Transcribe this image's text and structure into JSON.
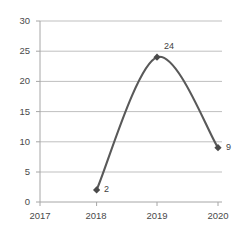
{
  "chart_data": {
    "type": "line",
    "title": "",
    "subtitle": "",
    "xlabel": "",
    "ylabel": "",
    "x": [
      "2017",
      "2018",
      "2019",
      "2020"
    ],
    "categories": [
      "2017",
      "2018",
      "2019",
      "2020"
    ],
    "series": [
      {
        "name": "",
        "values": [
          null,
          2,
          24,
          9
        ],
        "color": "#595959",
        "marker": "diamond",
        "smooth": true
      }
    ],
    "point_labels": [
      {
        "x": "2018",
        "value": 2,
        "text": "2"
      },
      {
        "x": "2019",
        "value": 24,
        "text": "24"
      },
      {
        "x": "2020",
        "value": 9,
        "text": "9"
      }
    ],
    "ylim": [
      0,
      30
    ],
    "yticks": [
      0,
      5,
      10,
      15,
      20,
      25,
      30
    ],
    "ytick_labels": [
      "0",
      "5",
      "10",
      "15",
      "20",
      "25",
      "30"
    ],
    "xtick_labels": [
      "2017",
      "2018",
      "2019",
      "2020"
    ],
    "grid": true,
    "grid_axis": "y",
    "grid_color": "#bfbfbf",
    "axis_color": "#a6a6a6",
    "legend": false,
    "legend_position": "none",
    "background": "#ffffff"
  },
  "geometry": {
    "plot_left": 40,
    "plot_right": 222,
    "plot_top": 21,
    "plot_bottom": 202,
    "x_positions": [
      40,
      96.6,
      157,
      218
    ],
    "y_gridlines": [
      21,
      51.2,
      81.4,
      111.6,
      141.8,
      172,
      202
    ]
  }
}
